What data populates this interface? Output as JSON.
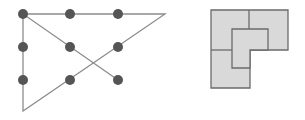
{
  "colors": {
    "line": "#8c8c8c",
    "dot": "#555555",
    "fill": "#d9d9d9",
    "stroke": "#6b6b6b"
  },
  "left_figure": {
    "name": "nine-dot-puzzle",
    "dots": [
      {
        "x": 23,
        "y": 14
      },
      {
        "x": 70,
        "y": 14
      },
      {
        "x": 118,
        "y": 14
      },
      {
        "x": 23,
        "y": 47
      },
      {
        "x": 70,
        "y": 47
      },
      {
        "x": 118,
        "y": 47
      },
      {
        "x": 23,
        "y": 80
      },
      {
        "x": 70,
        "y": 80
      },
      {
        "x": 118,
        "y": 80
      }
    ],
    "path": [
      {
        "x": 118,
        "y": 80
      },
      {
        "x": 23,
        "y": 14
      },
      {
        "x": 165,
        "y": 14
      },
      {
        "x": 23,
        "y": 111
      },
      {
        "x": 23,
        "y": 14
      }
    ]
  },
  "right_figure": {
    "name": "l-shape-dissection",
    "outline": "211,10 288,10 288,50 250,50 250,88 211,88",
    "dividers": [
      {
        "x1": 249,
        "y1": 10,
        "x2": 249,
        "y2": 29
      },
      {
        "x1": 211,
        "y1": 50,
        "x2": 232,
        "y2": 50
      }
    ],
    "inner_square": "232,29 268,29 268,50 250,50 250,68 232,68"
  }
}
